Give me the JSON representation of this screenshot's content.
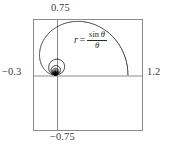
{
  "figure": {
    "background_color": "#ffffff",
    "frame_color": "#8a8a8a",
    "axis_color": "#8a8a8a",
    "curve_color": "#1f1f1f",
    "text_color": "#3a3a3a"
  },
  "labels": {
    "top": "0.75",
    "bottom": "−0.75",
    "left": "−0.3",
    "right": "1.2"
  },
  "equation": {
    "lhs": "r",
    "equals": "=",
    "numerator_fn": "sin",
    "numerator_var": "θ",
    "denominator": "θ",
    "plain": "r = sin θ / θ"
  },
  "chart_data": {
    "type": "line",
    "title": "",
    "subtitle": "",
    "plot_kind": "polar",
    "equation": "r = sin(θ)/θ",
    "xlabel": "",
    "ylabel": "",
    "xlim": [
      -0.3,
      1.2
    ],
    "ylim": [
      -0.75,
      0.75
    ],
    "tick_labels": {
      "x": [
        "−0.3",
        "1.2"
      ],
      "y": [
        "−0.75",
        "0.75"
      ]
    },
    "grid": false,
    "legend": null,
    "annotations": [
      {
        "text": "r = sin θ / θ",
        "x": 0.45,
        "y": 0.5
      }
    ],
    "axes_drawn": [
      "x-axis at y=0",
      "y-axis at x=0"
    ],
    "theta_range_deg": [
      0.5,
      5400
    ],
    "series": [
      {
        "name": "r = sin(theta)/theta",
        "color": "#1f1f1f",
        "description": "Polar spiral: large primary loop extending right to x=1.0, with successively smaller nested loops converging on the origin"
      }
    ]
  }
}
